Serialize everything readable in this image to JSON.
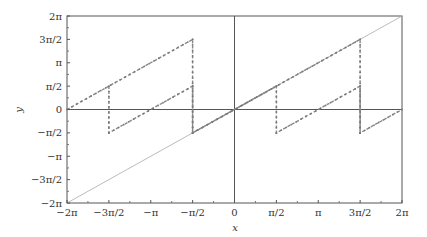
{
  "chart_data": {
    "type": "line",
    "title": "",
    "xlabel": "x",
    "ylabel": "y",
    "xlim": [
      -6.2832,
      6.2832
    ],
    "ylim": [
      -6.2832,
      6.2832
    ],
    "grid": false,
    "x_ticks": [
      "-2π",
      "-3π/2",
      "-π",
      "-π/2",
      "0",
      "π/2",
      "π",
      "3π/2",
      "2π"
    ],
    "y_ticks": [
      "-2π",
      "-3π/2",
      "-π",
      "-π/2",
      "0",
      "π/2",
      "π",
      "3π/2",
      "2π"
    ],
    "series": [
      {
        "name": "y = x",
        "style": "thin solid",
        "color": "#aaaaaa",
        "points": [
          [
            -6.2832,
            -6.2832
          ],
          [
            6.2832,
            6.2832
          ]
        ]
      },
      {
        "name": "upper sawtooth",
        "style": "dashed with markers",
        "color": "#888888",
        "points": [
          [
            -6.2832,
            0
          ],
          [
            -1.5708,
            4.7124
          ],
          [
            -1.5708,
            -1.5708
          ],
          [
            4.7124,
            4.7124
          ],
          [
            4.7124,
            -1.5708
          ],
          [
            6.2832,
            0
          ]
        ]
      },
      {
        "name": "lower sawtooth",
        "style": "dashed with markers",
        "color": "#888888",
        "points": [
          [
            -4.7124,
            1.5708
          ],
          [
            -4.7124,
            -1.5708
          ],
          [
            -1.5708,
            1.5708
          ],
          [
            -1.5708,
            -1.5708
          ],
          [
            1.5708,
            1.5708
          ],
          [
            1.5708,
            -1.5708
          ],
          [
            4.7124,
            1.5708
          ],
          [
            4.7124,
            -1.5708
          ]
        ]
      }
    ]
  },
  "labels": {
    "x": "x",
    "y": "y"
  }
}
